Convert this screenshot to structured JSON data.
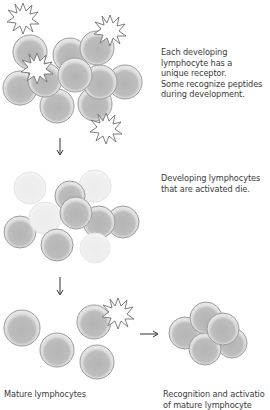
{
  "diagram": {
    "colors": {
      "cell_fill_outer": "#e6e6e6",
      "cell_fill_inner": "#b9b9b9",
      "cell_stroke": "#8f8f8f",
      "faded_fill": "#f3f3f3",
      "faded_stroke": "#dcdcdc",
      "starburst_stroke": "#6a6a6a",
      "arrow": "#333333",
      "text": "#3a3a3a"
    },
    "captions": {
      "step1": "Each developing\nlymphocyte has a\nunique receptor.\nSome recognize peptides\nduring development.",
      "step2": "Developing lymphocytes\nthat are activated die.",
      "step3_left": "Mature lymphocytes",
      "step3_right": "Recognition and activatio\nof mature lymphocyte"
    },
    "icons": {
      "cell": "lymphocyte-cell-icon",
      "antigen": "starburst-antigen-icon",
      "arrow_down": "arrow-down-icon",
      "arrow_right": "arrow-right-icon"
    }
  }
}
